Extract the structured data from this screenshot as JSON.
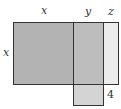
{
  "diagram": {
    "labels": {
      "top_x": "x",
      "top_y": "y",
      "top_z": "z",
      "left_x": "x",
      "bottom_4": "4"
    },
    "colors": {
      "x_region": "#b3b3b3",
      "y_region": "#bdbdbd",
      "z_region": "#ececec",
      "extension": "#d4d4d4",
      "stroke": "#333333"
    }
  }
}
